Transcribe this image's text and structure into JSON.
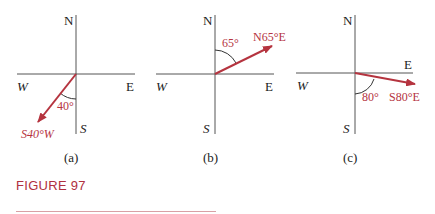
{
  "figure": {
    "label": "FIGURE 97",
    "accent_color": "#b03040"
  },
  "panels": [
    {
      "caption": "(a)",
      "north": "N",
      "south": "S",
      "east": "E",
      "west": "W",
      "angle_label": "40°",
      "bearing_label": "S40°W"
    },
    {
      "caption": "(b)",
      "north": "N",
      "south": "S",
      "east": "E",
      "west": "W",
      "angle_label": "65°",
      "bearing_label": "N65°E"
    },
    {
      "caption": "(c)",
      "north": "N",
      "south": "S",
      "east": "E",
      "west": "W",
      "angle_label": "80°",
      "bearing_label": "S80°E"
    }
  ]
}
